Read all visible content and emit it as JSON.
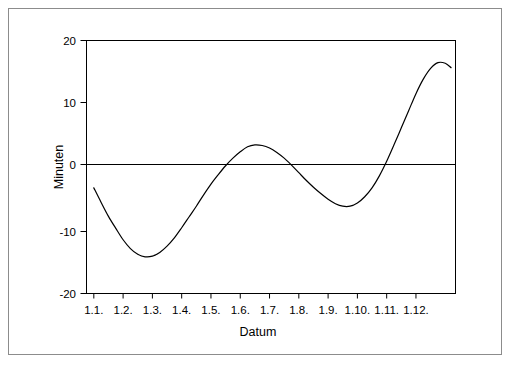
{
  "chart_data": {
    "type": "line",
    "title": "",
    "subtitle": "",
    "xlabel": "Datum",
    "ylabel": "Minuten",
    "xtick_labels": [
      "1.1.",
      "1.2.",
      "1.3.",
      "1.4.",
      "1.5.",
      "1.6.",
      "1.7.",
      "1.8.",
      "1.9.",
      "1.10.",
      "1.11.",
      "1.12."
    ],
    "ytick_labels": [
      "20",
      "10",
      "0",
      "-10",
      "-20"
    ],
    "ytick_values": [
      20,
      10,
      0,
      -10,
      -20
    ],
    "ylim": [
      -20,
      20
    ],
    "xlim": [
      0,
      12.6
    ],
    "grid": false,
    "legend": false,
    "zero_line": true,
    "line_color": "#000000",
    "frame_color": "#000000",
    "background_color": "#ffffff",
    "series": [
      {
        "name": "Zeitgleichung",
        "x": [
          0.25,
          0.5,
          0.75,
          1.0,
          1.25,
          1.5,
          1.75,
          2.0,
          2.25,
          2.5,
          2.75,
          3.0,
          3.25,
          3.5,
          3.75,
          4.0,
          4.25,
          4.5,
          4.75,
          5.0,
          5.25,
          5.5,
          5.75,
          6.0,
          6.25,
          6.5,
          6.75,
          7.0,
          7.25,
          7.5,
          7.75,
          8.0,
          8.25,
          8.5,
          8.75,
          9.0,
          9.25,
          9.5,
          9.75,
          10.0,
          10.25,
          10.5,
          10.75,
          11.0,
          11.25,
          11.5,
          11.75,
          12.0,
          12.25,
          12.45
        ],
        "y": [
          -3.3,
          -5.6,
          -7.8,
          -9.7,
          -11.5,
          -12.9,
          -13.8,
          -14.2,
          -14.1,
          -13.5,
          -12.5,
          -11.2,
          -9.6,
          -7.9,
          -6.2,
          -4.4,
          -2.7,
          -1.2,
          0.2,
          1.4,
          2.4,
          3.2,
          3.5,
          3.4,
          3.0,
          2.3,
          1.4,
          0.3,
          -0.9,
          -2.1,
          -3.2,
          -4.2,
          -5.1,
          -5.8,
          -6.2,
          -6.2,
          -5.7,
          -4.7,
          -3.3,
          -1.4,
          0.9,
          3.5,
          6.2,
          8.9,
          11.6,
          13.9,
          15.6,
          16.5,
          16.4,
          15.7
        ],
        "annotations": {
          "start_value": -3.3,
          "winter_min": -14.2,
          "spring_max": 3.5,
          "summer_min": -6.2,
          "autumn_max": 16.5,
          "end_value": -3.3
        }
      }
    ]
  },
  "figure": {
    "ylabel": "Minuten",
    "xlabel": "Datum"
  }
}
